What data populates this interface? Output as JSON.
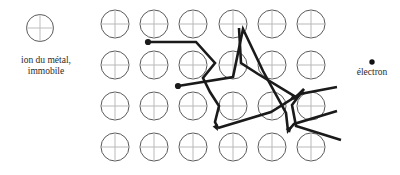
{
  "figure": {
    "background_color": "#ffffff",
    "width": 400,
    "height": 175
  },
  "legend": {
    "metal_ion": {
      "label": "ion du métal,\nimmobile",
      "icon": "circle-with-cross-icon",
      "icon_color": "#5a5a5a",
      "icon_center": {
        "x": 40,
        "y": 28
      },
      "icon_radius": 13.5
    },
    "electron": {
      "label": "électron",
      "icon": "filled-dot-icon",
      "icon_color": "#111111",
      "icon_center": {
        "x": 372,
        "y": 62
      },
      "icon_radius": 2.6
    }
  },
  "lattice": {
    "description": "Réseau d'ions métalliques immobiles",
    "ion_icon": "circle-with-cross-icon",
    "circle_color": "#5a5a5a",
    "cross_color": "#b9b9b9",
    "radius": 14,
    "columns_x": [
      115,
      154,
      193,
      233,
      272,
      311
    ],
    "rows_y": [
      24,
      65,
      106,
      147
    ]
  },
  "electron_paths": {
    "stroke_color": "#1a1a1a",
    "stroke_width": 2.6,
    "start_dot_radius": 3.1,
    "paths": [
      {
        "name": "electron-path-1",
        "start": {
          "x": 148,
          "y": 42
        },
        "points": "148,42 196,42 215,63 203,78 210,92 219,106 215,122 218,128",
        "arrow_at": {
          "x": 218,
          "y": 131
        }
      },
      {
        "name": "electron-path-2",
        "start": {
          "x": 178,
          "y": 86
        },
        "points": "178,86 233,77 243,29 263,71 286,113 288,131 294,124 337,111",
        "arrow_at": {
          "x": 292,
          "y": 126
        }
      },
      {
        "name": "electron-path-3",
        "points": "239,28 241,63 258,74 296,97 304,89 292,105 296,126 341,140",
        "arrow_at": {
          "x": 297,
          "y": 100
        }
      },
      {
        "name": "electron-path-4",
        "points": "218,128 271,112 300,94 337,87"
      }
    ]
  },
  "colors": {
    "ink": "#1a1a1a",
    "ion_outline": "#5a5a5a",
    "ion_cross": "#bdbdbd",
    "text": "#2a2a2a",
    "background": "#ffffff"
  }
}
